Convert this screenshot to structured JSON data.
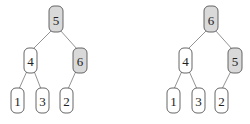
{
  "colors": {
    "highlight_fill": "#d9d9d9",
    "normal_fill": "#ffffff",
    "stroke": "#555555",
    "edge": "#777777"
  },
  "trees": [
    {
      "name": "before-swap",
      "nodes": [
        {
          "id": "root",
          "label": "5",
          "highlighted": true,
          "x": 49,
          "y": 6,
          "w": 14,
          "h": 26
        },
        {
          "id": "left",
          "label": "4",
          "highlighted": false,
          "x": 24,
          "y": 48,
          "w": 13,
          "h": 25
        },
        {
          "id": "right",
          "label": "6",
          "highlighted": true,
          "x": 73,
          "y": 48,
          "w": 14,
          "h": 25
        },
        {
          "id": "ll",
          "label": "1",
          "highlighted": false,
          "x": 11,
          "y": 88,
          "w": 13,
          "h": 25
        },
        {
          "id": "lr",
          "label": "3",
          "highlighted": false,
          "x": 36,
          "y": 88,
          "w": 13,
          "h": 25
        },
        {
          "id": "rl",
          "label": "2",
          "highlighted": false,
          "x": 60,
          "y": 88,
          "w": 13,
          "h": 25
        }
      ]
    },
    {
      "name": "after-swap",
      "nodes": [
        {
          "id": "root",
          "label": "6",
          "highlighted": true,
          "x": 204,
          "y": 6,
          "w": 14,
          "h": 26
        },
        {
          "id": "left",
          "label": "4",
          "highlighted": false,
          "x": 179,
          "y": 48,
          "w": 13,
          "h": 25
        },
        {
          "id": "right",
          "label": "5",
          "highlighted": true,
          "x": 228,
          "y": 48,
          "w": 14,
          "h": 25
        },
        {
          "id": "ll",
          "label": "1",
          "highlighted": false,
          "x": 167,
          "y": 88,
          "w": 13,
          "h": 25
        },
        {
          "id": "lr",
          "label": "3",
          "highlighted": false,
          "x": 192,
          "y": 88,
          "w": 13,
          "h": 25
        },
        {
          "id": "rl",
          "label": "2",
          "highlighted": false,
          "x": 215,
          "y": 88,
          "w": 13,
          "h": 25
        }
      ]
    }
  ]
}
